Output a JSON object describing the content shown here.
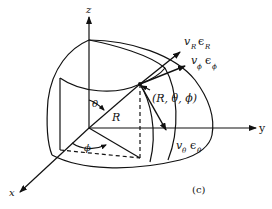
{
  "figure": {
    "panel_label": "(c)",
    "axes": {
      "x": "x",
      "y": "y",
      "z": "z"
    },
    "radius_label": "R",
    "polar_angle_label": "θ",
    "azimuth_angle_label": "ϕ",
    "point_label": "(R, θ, ϕ)",
    "vectors": [
      {
        "name": "radial",
        "coef": "v",
        "coef_sub": "R",
        "basis": "ϵ",
        "basis_sub": "R"
      },
      {
        "name": "azimuthal",
        "coef": "v",
        "coef_sub": "ϕ",
        "basis": "ϵ",
        "basis_sub": "ϕ"
      },
      {
        "name": "polar",
        "coef": "v",
        "coef_sub": "θ",
        "basis": "ϵ",
        "basis_sub": "θ"
      }
    ],
    "colors": {
      "ink": "#111111",
      "background": "#ffffff"
    }
  }
}
